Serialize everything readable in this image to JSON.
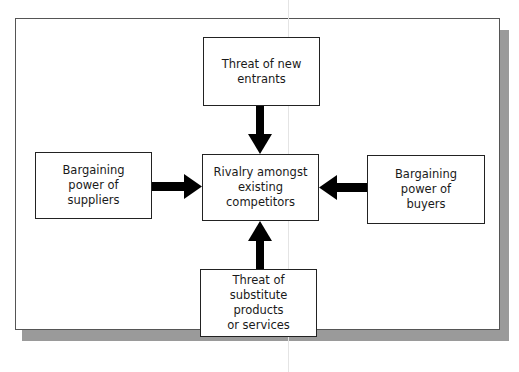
{
  "diagram": {
    "colors": {
      "box_border": "#222222",
      "arrow": "#000000",
      "shadow": "#9a9a9a",
      "frame_border": "#555555"
    },
    "nodes": [
      {
        "id": "new_entrants",
        "label": "Threat of new\nentrants",
        "position": "top"
      },
      {
        "id": "suppliers",
        "label": "Bargaining\npower of\nsuppliers",
        "position": "left"
      },
      {
        "id": "rivalry",
        "label": "Rivalry amongst\nexisting\ncompetitors",
        "position": "center"
      },
      {
        "id": "buyers",
        "label": "Bargaining\npower of\nbuyers",
        "position": "right"
      },
      {
        "id": "substitutes",
        "label": "Threat of\nsubstitute products\nor services",
        "position": "bottom"
      }
    ],
    "edges": [
      {
        "from": "new_entrants",
        "to": "rivalry",
        "type": "arrow"
      },
      {
        "from": "suppliers",
        "to": "rivalry",
        "type": "arrow"
      },
      {
        "from": "buyers",
        "to": "rivalry",
        "type": "arrow"
      },
      {
        "from": "substitutes",
        "to": "rivalry",
        "type": "arrow"
      }
    ]
  }
}
